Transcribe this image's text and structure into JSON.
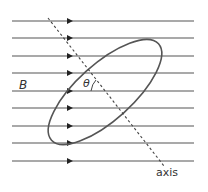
{
  "diagram": {
    "labels": {
      "field": "B",
      "angle": "θ",
      "axis": "axis"
    },
    "field_lines": {
      "count": 9,
      "y_positions": [
        21,
        38,
        56,
        73,
        91,
        108,
        126,
        143,
        161
      ],
      "x_start": 12,
      "x_end": 194,
      "arrow_x": 70,
      "direction": "right"
    },
    "loop": {
      "shape": "ellipse",
      "center": [
        105,
        92
      ],
      "rx": 72,
      "ry": 28,
      "rotation_deg": -42
    },
    "axis_line": {
      "style": "dashed",
      "from": [
        48,
        18
      ],
      "to": [
        164,
        166
      ]
    },
    "colors": {
      "line": "#555555",
      "text": "#333333"
    }
  }
}
